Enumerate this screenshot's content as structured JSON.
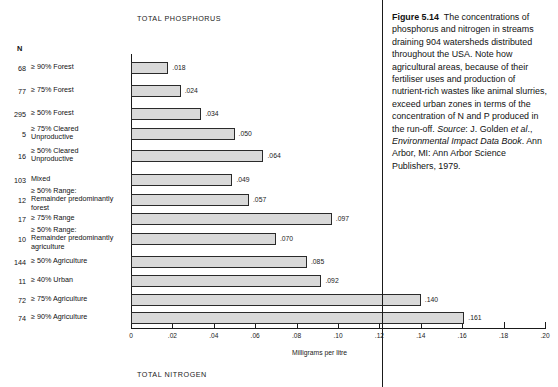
{
  "figure": {
    "chart_title_top": "TOTAL PHOSPHORUS",
    "chart_title_bottom": "TOTAL NITROGEN",
    "n_header": "N",
    "axis_caption": "Milligrams per litre"
  },
  "caption": {
    "label": "Figure 5.14",
    "body_1": "The concentrations of phosphorus and nitrogen in streams draining 904 watersheds distributed throughout the USA. Note how agricultural areas, because of their fertiliser uses and production of nutrient-rich wastes like animal slurries, exceed urban zones in terms of the concentration of N and P produced in the run-off.",
    "source_label": "Source",
    "source_sep": ": J. Golden ",
    "source_etal": "et al",
    "source_after_etal": "., ",
    "source_title": "Environmental Impact Data Book",
    "source_rest": ". Ann Arbor, MI: Ann Arbor Science Publishers, 1979."
  },
  "chart_data": {
    "type": "bar",
    "title": "TOTAL PHOSPHORUS",
    "xlabel": "Milligrams per litre",
    "ylabel": "",
    "xlim": [
      0,
      0.2
    ],
    "grid": false,
    "orientation": "horizontal",
    "xticks": [
      "0",
      ".02",
      ".04",
      ".06",
      ".08",
      ".10",
      ".12",
      ".14",
      ".16",
      ".18",
      ".20"
    ],
    "xtick_values": [
      0,
      0.02,
      0.04,
      0.06,
      0.08,
      0.1,
      0.12,
      0.14,
      0.16,
      0.18,
      0.2
    ],
    "n_column": [
      68,
      77,
      295,
      5,
      16,
      103,
      12,
      17,
      10,
      144,
      11,
      72,
      74
    ],
    "categories": [
      "≥ 90% Forest",
      "≥ 75% Forest",
      "≥ 50% Forest",
      "≥ 75% Cleared Unproductive",
      "≥ 50% Cleared Unproductive",
      "Mixed",
      "≥ 50% Range: Remainder predominantly forest",
      "≥ 75% Range",
      "≥ 50% Range: Remainder predominantly agriculture",
      "≥ 50% Agriculture",
      "≥ 40% Urban",
      "≥ 75% Agriculture",
      "≥ 90% Agriculture"
    ],
    "values": [
      0.018,
      0.024,
      0.034,
      0.05,
      0.064,
      0.049,
      0.057,
      0.097,
      0.07,
      0.085,
      0.092,
      0.14,
      0.161
    ],
    "value_labels": [
      ".018",
      ".024",
      ".034",
      ".050",
      ".064",
      ".049",
      ".057",
      ".097",
      ".070",
      ".085",
      ".092",
      ".140",
      ".161"
    ]
  },
  "rows": [
    {
      "n": "68",
      "label_lines": [
        "≥ 90% Forest"
      ],
      "value": ".018",
      "v": 0.018
    },
    {
      "n": "77",
      "label_lines": [
        "≥ 75% Forest"
      ],
      "value": ".024",
      "v": 0.024
    },
    {
      "n": "295",
      "label_lines": [
        "≥ 50% Forest"
      ],
      "value": ".034",
      "v": 0.034
    },
    {
      "n": "5",
      "label_lines": [
        "≥ 75% Cleared",
        "Unproductive"
      ],
      "value": ".050",
      "v": 0.05
    },
    {
      "n": "16",
      "label_lines": [
        "≥ 50% Cleared",
        "Unproductive"
      ],
      "value": ".064",
      "v": 0.064
    },
    {
      "n": "103",
      "label_lines": [
        "Mixed"
      ],
      "value": ".049",
      "v": 0.049
    },
    {
      "n": "12",
      "label_lines": [
        "≥ 50% Range:",
        "Remainder predominantly",
        "forest"
      ],
      "value": ".057",
      "v": 0.057
    },
    {
      "n": "17",
      "label_lines": [
        "≥ 75% Range"
      ],
      "value": ".097",
      "v": 0.097
    },
    {
      "n": "10",
      "label_lines": [
        "≥ 50% Range:",
        "Remainder predominantly",
        "agriculture"
      ],
      "value": ".070",
      "v": 0.07
    },
    {
      "n": "144",
      "label_lines": [
        "≥ 50% Agriculture"
      ],
      "value": ".085",
      "v": 0.085
    },
    {
      "n": "11",
      "label_lines": [
        "≥ 40% Urban"
      ],
      "value": ".092",
      "v": 0.092
    },
    {
      "n": "72",
      "label_lines": [
        "≥ 75% Agriculture"
      ],
      "value": ".140",
      "v": 0.14
    },
    {
      "n": "74",
      "label_lines": [
        "≥ 90% Agriculture"
      ],
      "value": ".161",
      "v": 0.161
    }
  ]
}
